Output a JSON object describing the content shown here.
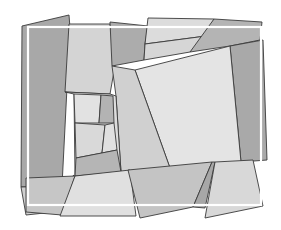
{
  "canvas": {
    "width": 281,
    "height": 230,
    "background": "#ffffff"
  },
  "palette": {
    "dark": "#a9a9a9",
    "mid": "#bdbdbd",
    "light": "#d2d2d2",
    "pale": "#e3e3e3",
    "stroke": "#3a3a3a",
    "frame": "#ffffff"
  },
  "polygons": [
    {
      "name": "left-dark-panel",
      "fill": "#a8a8a8",
      "points": "22,26 69,15 70,28 62,186 21,187"
    },
    {
      "name": "top-left-light-panel",
      "fill": "#d4d4d4",
      "points": "69,24 110,24 116,60 110,94 65,92"
    },
    {
      "name": "top-mid-dark-panel",
      "fill": "#acacac",
      "points": "110,22 148,26 145,44 144,60 112,66"
    },
    {
      "name": "top-center-pale-strip",
      "fill": "#dcdcdc",
      "points": "148,18 214,19 206,36 145,44"
    },
    {
      "name": "top-center-light-strip",
      "fill": "#d6d6d6",
      "points": "145,44 206,36 190,52 144,60"
    },
    {
      "name": "top-right-dark-wedge",
      "fill": "#b4b4b4",
      "points": "214,19 262,22 260,40 230,46 190,52"
    },
    {
      "name": "right-dark-column",
      "fill": "#a9a9a9",
      "points": "230,46 263,40 267,160 241,162"
    },
    {
      "name": "center-large-pale-square",
      "fill": "#e4e4e4",
      "points": "135,70 230,46 241,162 170,168"
    },
    {
      "name": "center-left-light-panel",
      "fill": "#d0d0d0",
      "points": "112,66 135,70 170,168 121,172 116,96"
    },
    {
      "name": "mid-left-pale-panel",
      "fill": "#dddddd",
      "points": "65,92 110,94 116,96 121,172 75,176 74,94"
    },
    {
      "name": "small-pale-cell-top",
      "fill": "#e2e2e2",
      "points": "74,94 101,95 99,123 75,123"
    },
    {
      "name": "small-dark-cell",
      "fill": "#b3b3b3",
      "points": "101,95 113,96 114,123 99,123"
    },
    {
      "name": "small-pale-cell-bottom",
      "fill": "#d9d9d9",
      "points": "75,123 105,125 102,153 76,158"
    },
    {
      "name": "small-light-cell-right",
      "fill": "#e0e0e0",
      "points": "105,125 114,123 117,150 102,153"
    },
    {
      "name": "lower-center-dark-band",
      "fill": "#b5b5b5",
      "points": "76,158 117,150 121,172 75,176"
    },
    {
      "name": "left-lower-light-band",
      "fill": "#d0d0d0",
      "points": "62,186 21,187 26,215 63,211 74,175"
    },
    {
      "name": "bottom-left-light-panel",
      "fill": "#c6c6c6",
      "points": "26,178 75,176 62,215 26,212"
    },
    {
      "name": "bottom-center-pale-trapezoid",
      "fill": "#e0e0e0",
      "points": "75,176 130,170 136,216 60,216"
    },
    {
      "name": "bottom-center-mid-panel",
      "fill": "#c4c4c4",
      "points": "128,170 212,162 193,207 140,218"
    },
    {
      "name": "bottom-thin-dark-sliver",
      "fill": "#a7a7a7",
      "points": "212,162 215,162 205,208 193,207"
    },
    {
      "name": "bottom-right-pale-panel",
      "fill": "#d8d8d8",
      "points": "215,162 253,160 263,206 205,218"
    }
  ],
  "frame": {
    "x": 28,
    "y": 27,
    "width": 233,
    "height": 178
  }
}
